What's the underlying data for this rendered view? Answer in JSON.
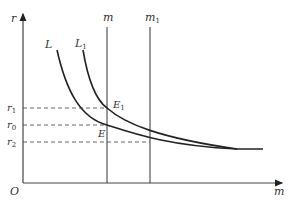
{
  "diagram": {
    "axes": {
      "y_label": "r",
      "x_label": "m",
      "origin_label": "O"
    },
    "vertical_lines": [
      {
        "label": "m",
        "sub": "",
        "x": 107
      },
      {
        "label": "m",
        "sub": "1",
        "x": 150
      }
    ],
    "curves": [
      {
        "label": "L",
        "sub": ""
      },
      {
        "label": "L",
        "sub": "1"
      }
    ],
    "levels": [
      {
        "label": "r",
        "sub": "1",
        "y": 108
      },
      {
        "label": "r",
        "sub": "0",
        "y": 125
      },
      {
        "label": "r",
        "sub": "2",
        "y": 142
      }
    ],
    "points": [
      {
        "label": "E",
        "sub": "1"
      },
      {
        "label": "E",
        "sub": ""
      }
    ],
    "colors": {
      "line": "#222222",
      "axis": "#444444",
      "dashed": "#555555"
    }
  }
}
